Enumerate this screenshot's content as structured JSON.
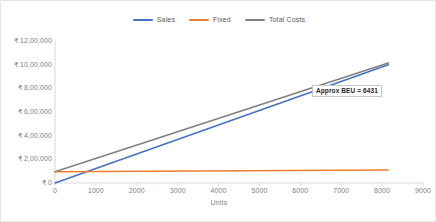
{
  "chart_data": {
    "type": "line",
    "title": "",
    "xlabel": "Units",
    "ylabel": "",
    "xlim": [
      0,
      9000
    ],
    "ylim": [
      0,
      1200000
    ],
    "grid": false,
    "legend_position": "top",
    "x_ticks": [
      "0",
      "1000",
      "2000",
      "3000",
      "4000",
      "5000",
      "6000",
      "7000",
      "8000",
      "9000"
    ],
    "x_tick_values": [
      0,
      1000,
      2000,
      3000,
      4000,
      5000,
      6000,
      7000,
      8000,
      9000
    ],
    "y_ticks": [
      "₹ 0",
      "₹ 2,00,000",
      "₹ 4,00,000",
      "₹ 6,00,000",
      "₹ 8,00,000",
      "₹ 10,00,000",
      "₹ 12,00,000"
    ],
    "y_tick_values": [
      0,
      200000,
      400000,
      600000,
      800000,
      1000000,
      1200000
    ],
    "series": [
      {
        "name": "Sales",
        "color": "#4472C4",
        "x": [
          0,
          8150
        ],
        "values": [
          0,
          1000000
        ]
      },
      {
        "name": "Fixed",
        "color": "#ED7D31",
        "x": [
          0,
          8150
        ],
        "values": [
          95000,
          110000
        ]
      },
      {
        "name": "Total Costs",
        "color": "#808080",
        "x": [
          0,
          8150
        ],
        "values": [
          95000,
          1015000
        ]
      }
    ],
    "annotations": [
      {
        "label": "Approx BEU = 6431",
        "x": 6431,
        "y": 790000,
        "marker": "diamond",
        "marker_color": "#ED7D31"
      }
    ]
  },
  "legend": {
    "items": [
      {
        "label": "Sales",
        "color": "#4472C4"
      },
      {
        "label": "Fixed",
        "color": "#ED7D31"
      },
      {
        "label": "Total Costs",
        "color": "#808080"
      }
    ]
  },
  "axis": {
    "x_title": "Units"
  },
  "colors": {
    "sales": "#4472C4",
    "fixed": "#ED7D31",
    "total_costs": "#808080",
    "axis_text": "#808080",
    "border": "#e6e6e6"
  }
}
